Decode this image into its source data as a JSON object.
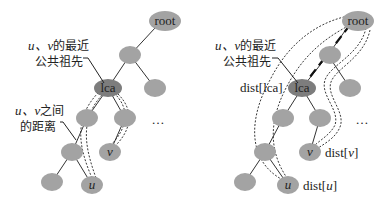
{
  "diagram": {
    "type": "tree-lca-illustration",
    "left_panel": {
      "nodes": {
        "root": "root",
        "lca": "lca",
        "u": "u",
        "v": "v",
        "ellipsis": "…"
      },
      "annotations": {
        "lca_label_line1_var": "u、v",
        "lca_label_line1_rest": "的最近",
        "lca_label_line2": "公共祖先",
        "distance_label_line1_var": "u、v",
        "distance_label_line1_rest": "之间",
        "distance_label_line2": "的距离"
      }
    },
    "right_panel": {
      "nodes": {
        "root": "root",
        "lca": "lca",
        "u": "u",
        "v": "v",
        "ellipsis": "…"
      },
      "annotations": {
        "lca_label_line1_var": "u、v",
        "lca_label_line1_rest": "的最近",
        "lca_label_line2": "公共祖先",
        "dist_lca_prefix": "dist[",
        "dist_lca_var": "lca",
        "dist_lca_suffix": "]",
        "dist_v_prefix": "dist[",
        "dist_v_var": "v",
        "dist_v_suffix": "]",
        "dist_u_prefix": "dist[",
        "dist_u_var": "u",
        "dist_u_suffix": "]"
      }
    },
    "colors": {
      "node_fill": "#a3a3a3",
      "lca_fill": "#7d7d7d",
      "edge": "#333333"
    }
  }
}
